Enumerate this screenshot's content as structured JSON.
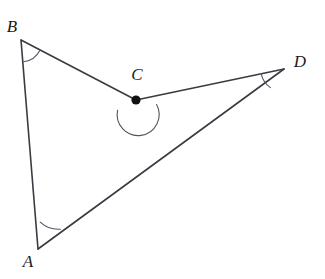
{
  "figure": {
    "background_color": "#ffffff",
    "line_color": "#3a3a42",
    "arc_color": "#55555d",
    "label_color": "#1a1a1a",
    "dot_color": "#111111"
  },
  "labels": {
    "a": "A",
    "b": "B",
    "c": "C",
    "d": "D"
  },
  "points": {
    "A": {
      "name": "A",
      "x": 38,
      "y": 249
    },
    "B": {
      "name": "B",
      "x": 21,
      "y": 40
    },
    "C": {
      "name": "C",
      "x": 136,
      "y": 100
    },
    "D": {
      "name": "D",
      "x": 284,
      "y": 69
    }
  },
  "label_positions": {
    "A": {
      "x": 28,
      "y": 263
    },
    "B": {
      "x": 12,
      "y": 28
    },
    "C": {
      "x": 137,
      "y": 76
    },
    "D": {
      "x": 300,
      "y": 63
    }
  },
  "segments": [
    {
      "name": "segment-BA",
      "from": "B",
      "to": "A",
      "path": "M21,40 L38,249"
    },
    {
      "name": "segment-BC",
      "from": "B",
      "to": "C",
      "path": "M21,40 L136,100"
    },
    {
      "name": "segment-CD",
      "from": "C",
      "to": "D",
      "path": "M136,100 L284,69"
    },
    {
      "name": "segment-AD",
      "from": "A",
      "to": "D",
      "path": "M38,249 L284,69"
    }
  ],
  "angle_marks": [
    {
      "name": "angle-arc-B",
      "vertex": "B",
      "type": "simple",
      "radius": 22,
      "path": "M23.8,61.8 A22,22 0 0 0 40.0,50.2"
    },
    {
      "name": "angle-arc-A",
      "vertex": "A",
      "type": "simple",
      "radius": 27,
      "path": "M40.2,222.1 A27,27 0 0 0 60.4,229.2"
    },
    {
      "name": "angle-arc-D",
      "vertex": "D",
      "type": "simple",
      "radius": 23,
      "path": "M261.2,73.8 A23,23 0 0 0 270.4,87.6"
    },
    {
      "name": "angle-arc-C-reflex",
      "vertex": "C",
      "type": "reflex",
      "radius": 21,
      "path": "M117.6,110.2 A21,21 0 1 0 156.6,104.6"
    }
  ],
  "vertex_dots": [
    {
      "name": "point-dot-C",
      "at": "C",
      "radius": 4.6
    }
  ]
}
